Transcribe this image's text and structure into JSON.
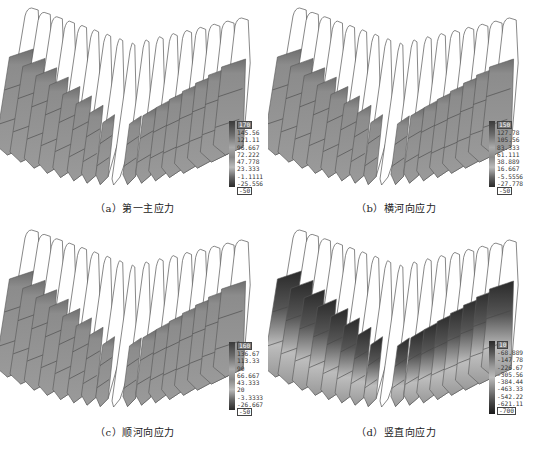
{
  "figure": {
    "panels": [
      {
        "id": "a",
        "caption": "（a）第一主应力",
        "shading": "uniform-gray",
        "legend": {
          "top_box": "170",
          "values": [
            "145.56",
            "121.11",
            "96.667",
            "72.222",
            "47.778",
            "23.333",
            "-1.1111",
            "-25.556"
          ],
          "bottom_box": "-50"
        }
      },
      {
        "id": "b",
        "caption": "（b）横河向应力",
        "shading": "uniform-gray",
        "legend": {
          "top_box": "150",
          "values": [
            "127.78",
            "105.56",
            "83.333",
            "61.111",
            "38.889",
            "16.667",
            "-5.5556",
            "-27.778"
          ],
          "bottom_box": "-50"
        }
      },
      {
        "id": "c",
        "caption": "（c）顺河向应力",
        "shading": "uniform-gray",
        "legend": {
          "top_box": "160",
          "values": [
            "136.67",
            "113.33",
            "90",
            "66.667",
            "43.333",
            "20",
            "-3.3333",
            "-26.667"
          ],
          "bottom_box": "-50"
        }
      },
      {
        "id": "d",
        "caption": "（d）竖直向应力",
        "shading": "dark-gradient",
        "legend": {
          "top_box": "10",
          "values": [
            "-68.889",
            "-147.78",
            "-226.67",
            "-305.56",
            "-384.44",
            "-463.33",
            "-542.22",
            "-621.11"
          ],
          "bottom_box": "-700"
        }
      }
    ],
    "colors": {
      "outline": "#555555",
      "slab_gray": "#8c8c8c",
      "slab_dark": "#2a2a2a",
      "slab_light": "#bdbdbd",
      "background": "#ffffff"
    }
  }
}
